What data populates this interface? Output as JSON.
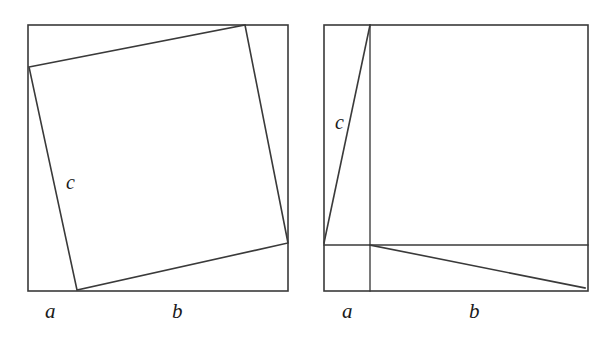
{
  "figure": {
    "background_color": "#ffffff",
    "stroke_color": "#3a3a3a",
    "width": 608,
    "height": 340
  },
  "panels": [
    {
      "id": "left",
      "name": "tilted-inner-square-panel",
      "outer_square": {
        "x": 28,
        "y": 25,
        "side": 263
      },
      "inner_square_vertices": [
        {
          "x": 29,
          "y": 67
        },
        {
          "x": 245,
          "y": 25
        },
        {
          "x": 288,
          "y": 243
        },
        {
          "x": 77,
          "y": 290
        }
      ],
      "labels": [
        {
          "text": "c",
          "name": "label-c-left",
          "x": 66,
          "y": 172,
          "size": 20
        },
        {
          "text": "a",
          "name": "label-a-left",
          "x": 45,
          "y": 301,
          "size": 21
        },
        {
          "text": "b",
          "name": "label-b-left",
          "x": 172,
          "y": 301,
          "size": 21
        }
      ]
    },
    {
      "id": "right",
      "name": "rearranged-squares-panel",
      "outer_square": {
        "x": 20,
        "y": 25,
        "side": 263
      },
      "vertical_divider_x": 66,
      "horizontal_divider_y": 245,
      "triangle_upper": [
        {
          "x": 66,
          "y": 25
        },
        {
          "x": 20,
          "y": 243
        },
        {
          "x": 66,
          "y": 245
        }
      ],
      "triangle_lower": [
        {
          "x": 66,
          "y": 245
        },
        {
          "x": 280,
          "y": 288
        },
        {
          "x": 66,
          "y": 288
        }
      ],
      "labels": [
        {
          "text": "c",
          "name": "label-c-right",
          "x": 31,
          "y": 112,
          "size": 20
        },
        {
          "text": "a",
          "name": "label-a-right",
          "x": 38,
          "y": 301,
          "size": 21
        },
        {
          "text": "b",
          "name": "label-b-right",
          "x": 165,
          "y": 301,
          "size": 21
        }
      ]
    }
  ]
}
